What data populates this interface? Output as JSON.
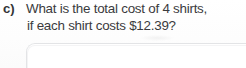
{
  "worksheet": {
    "question": {
      "label": "c)",
      "lines": [
        "What is the total cost of 4 shirts,",
        "if each shirt costs $12.39?"
      ],
      "full_text": "What is the total cost of 4 shirts, if each shirt costs $12.39?",
      "quantity": "4",
      "item": "shirts",
      "unit_price": "$12.39"
    },
    "answer_box": {
      "value": "",
      "placeholder": ""
    },
    "colors": {
      "page_background": "#fefefe",
      "text": "#3a3b3d",
      "label_text": "#333436",
      "answer_box_border": "#e3e4e6"
    }
  }
}
